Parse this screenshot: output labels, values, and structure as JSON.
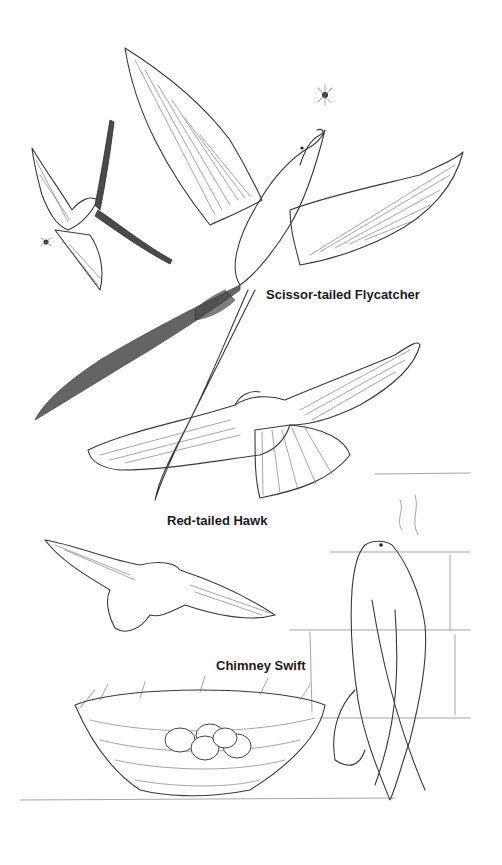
{
  "illustration": {
    "style": "pen-and-ink line drawing",
    "background_color": "#ffffff",
    "ink_color": "#3a3a3a"
  },
  "labels": {
    "flycatcher": "Scissor-tailed Flycatcher",
    "hawk": "Red-tailed Hawk",
    "swift": "Chimney Swift"
  },
  "subjects": [
    {
      "name": "Scissor-tailed Flycatcher",
      "count": 2,
      "detail": "large bird with wings spread and long forked tail, smaller one flying at left, insects nearby"
    },
    {
      "name": "Red-tailed Hawk",
      "count": 2,
      "detail": "soaring hawk seen from below plus a second hawk in flight"
    },
    {
      "name": "Chimney Swift",
      "count": 1,
      "detail": "swift clinging to a brick chimney wall"
    },
    {
      "name": "Nest",
      "count": 1,
      "detail": "twig nest holding 5 eggs"
    }
  ]
}
